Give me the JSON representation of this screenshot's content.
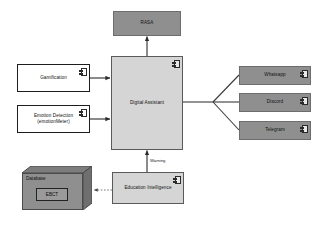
{
  "diagram": {
    "type": "uml-component-diagram",
    "background_color": "#ffffff",
    "colors": {
      "solid_node_fill": "#8f8f8f",
      "light_node_fill": "#d5d5d5",
      "white_node_fill": "#ffffff",
      "stroke": "#3a3a3a",
      "text": "#111111"
    },
    "nodes": {
      "rasa": {
        "label": "RASA",
        "style": "solid",
        "has_component_icon": false
      },
      "digital_assistant": {
        "label": "Digital Assistant",
        "style": "light",
        "has_component_icon": true
      },
      "gamification": {
        "label": "Gamification",
        "style": "white",
        "has_component_icon": true
      },
      "emotion_detection": {
        "label": "Emotion Detection (emotionMeter)",
        "line1": "Emotion Detection",
        "line2": "(emotionMeter)",
        "style": "white",
        "has_component_icon": true
      },
      "whatsapp": {
        "label": "Whatsapp",
        "style": "solid",
        "has_component_icon": true
      },
      "discord": {
        "label": "Discord",
        "style": "solid",
        "has_component_icon": true
      },
      "telegram": {
        "label": "Telegram",
        "style": "solid",
        "has_component_icon": true
      },
      "education_intelligence": {
        "label": "Education Intelligence",
        "style": "light",
        "has_component_icon": true
      },
      "database": {
        "label": "Database",
        "inner_label": "EBCT",
        "style": "solid-3d",
        "has_component_icon": false
      }
    },
    "edge_labels": {
      "warning": "Warning"
    },
    "edges": [
      {
        "from": "digital_assistant",
        "to": "rasa",
        "kind": "arrow"
      },
      {
        "from": "gamification",
        "to": "digital_assistant",
        "kind": "arrow"
      },
      {
        "from": "emotion_detection",
        "to": "digital_assistant",
        "kind": "arrow"
      },
      {
        "from": "education_intelligence",
        "to": "digital_assistant",
        "kind": "arrow",
        "label": "Warning"
      },
      {
        "from": "education_intelligence",
        "to": "database",
        "kind": "dashed-arrow"
      },
      {
        "from": "digital_assistant",
        "to": "whatsapp",
        "kind": "line"
      },
      {
        "from": "digital_assistant",
        "to": "discord",
        "kind": "line"
      },
      {
        "from": "digital_assistant",
        "to": "telegram",
        "kind": "line"
      }
    ]
  }
}
